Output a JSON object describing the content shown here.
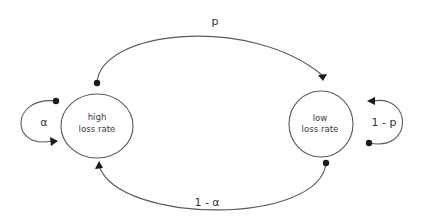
{
  "diagram": {
    "type": "markov-chain",
    "states": [
      {
        "id": "high",
        "line1": "high",
        "line2": "loss rate"
      },
      {
        "id": "low",
        "line1": "low",
        "line2": "loss rate"
      }
    ],
    "transitions": [
      {
        "from": "high",
        "to": "high",
        "label": "α"
      },
      {
        "from": "high",
        "to": "low",
        "label": "p"
      },
      {
        "from": "low",
        "to": "low",
        "label": "1 - p"
      },
      {
        "from": "low",
        "to": "high",
        "label": "1 - α"
      }
    ],
    "colors": {
      "stroke": "#5a5a5a",
      "marker": "#1a1a1a",
      "text": "#3c3c3c",
      "background": "#ffffff"
    }
  }
}
